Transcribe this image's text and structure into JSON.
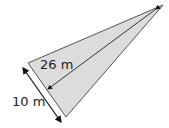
{
  "diagram": {
    "shape": "triangle",
    "fill_color": "#dcdcdc",
    "stroke_color": "#555555",
    "labels": {
      "height": "26 m",
      "base": "10 m"
    }
  }
}
